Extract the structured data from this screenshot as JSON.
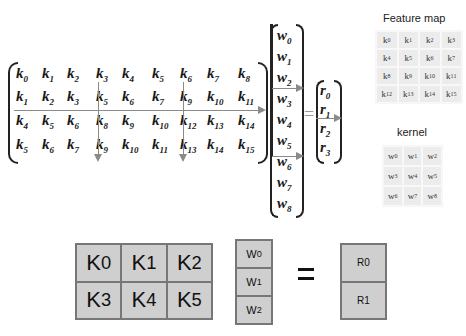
{
  "diagram": {
    "matrix_K": {
      "rows": [
        [
          "k0",
          "k1",
          "k2",
          "k3",
          "k4",
          "k5",
          "k6",
          "k7",
          "k8"
        ],
        [
          "k1",
          "k2",
          "k3",
          "k5",
          "k6",
          "k7",
          "k9",
          "k10",
          "k11"
        ],
        [
          "k4",
          "k5",
          "k6",
          "k8",
          "k9",
          "k10",
          "k12",
          "k13",
          "k14"
        ],
        [
          "k5",
          "k6",
          "k7",
          "k9",
          "k10",
          "k11",
          "k13",
          "k14",
          "k15"
        ]
      ]
    },
    "vector_w": [
      "w0",
      "w1",
      "w2",
      "w3",
      "w4",
      "w5",
      "w6",
      "w7",
      "w8"
    ],
    "equals": "=",
    "vector_r": [
      "r0",
      "r1",
      "r2",
      "r3"
    ],
    "feature_map": {
      "title": "Feature map",
      "cells": [
        [
          "k0",
          "k1",
          "k2",
          "k3"
        ],
        [
          "k4",
          "k5",
          "k6",
          "k7"
        ],
        [
          "k8",
          "k9",
          "k10",
          "k11"
        ],
        [
          "k12",
          "k13",
          "k14",
          "k15"
        ]
      ]
    },
    "kernel": {
      "title": "kernel",
      "cells": [
        [
          "w0",
          "w1",
          "w2"
        ],
        [
          "w3",
          "w4",
          "w5"
        ],
        [
          "w6",
          "w7",
          "w8"
        ]
      ]
    },
    "bottom": {
      "K_blocks": [
        [
          "K0",
          "K1",
          "K2"
        ],
        [
          "K3",
          "K4",
          "K5"
        ]
      ],
      "W_blocks": [
        "W0",
        "W1",
        "W2"
      ],
      "equals": "=",
      "R_blocks": [
        "R0",
        "R1"
      ]
    },
    "colors": {
      "grid_line": "#8a8a8a",
      "light_cell": "#ececec",
      "block_fill": "#cfcfcf",
      "block_border": "#777777"
    }
  }
}
